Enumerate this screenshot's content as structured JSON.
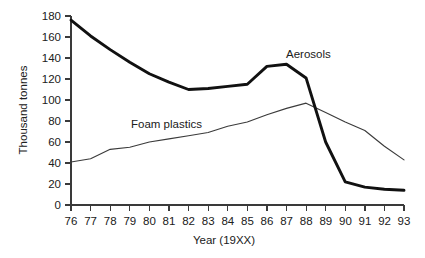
{
  "chart_data": {
    "type": "line",
    "title": "",
    "xlabel": "Year (19XX)",
    "ylabel": "Thousand tonnes",
    "xlim": [
      76,
      93
    ],
    "ylim": [
      0,
      180
    ],
    "grid": false,
    "legend_position": "inline-labels",
    "x": [
      76,
      77,
      78,
      79,
      80,
      81,
      82,
      83,
      84,
      85,
      86,
      87,
      88,
      89,
      90,
      91,
      92,
      93
    ],
    "xtick_labels": [
      "76",
      "77",
      "78",
      "79",
      "80",
      "81",
      "82",
      "83",
      "84",
      "85",
      "86",
      "87",
      "88",
      "89",
      "90",
      "91",
      "92",
      "93"
    ],
    "ytick_labels": [
      "0",
      "20",
      "40",
      "60",
      "80",
      "100",
      "120",
      "140",
      "160",
      "180"
    ],
    "ytick_values": [
      0,
      20,
      40,
      60,
      80,
      100,
      120,
      140,
      160,
      180
    ],
    "series": [
      {
        "name": "Aerosols",
        "label": "Aerosols",
        "color": "#111111",
        "line_width": "thick",
        "values": [
          176,
          161,
          148,
          136,
          125,
          117,
          110,
          111,
          113,
          115,
          132,
          134,
          121,
          60,
          22,
          17,
          15,
          14
        ],
        "label_position": {
          "x": 88.0,
          "y": 152
        }
      },
      {
        "name": "Foam plastics",
        "label": "Foam plastics",
        "color": "#3b3b3b",
        "line_width": "thin",
        "values": [
          41,
          44,
          53,
          55,
          60,
          63,
          66,
          69,
          75,
          79,
          86,
          92,
          97,
          88,
          79,
          71,
          56,
          43
        ],
        "label_position": {
          "x": 80.2,
          "y": 80
        }
      }
    ],
    "annotations": [
      {
        "text": "Aerosols",
        "kind": "series-label"
      },
      {
        "text": "Foam plastics",
        "kind": "series-label"
      }
    ]
  }
}
